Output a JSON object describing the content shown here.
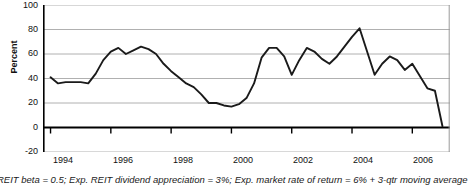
{
  "chart_data": {
    "type": "line",
    "title": "",
    "subtitle": "",
    "xlabel": "",
    "ylabel": "Percent",
    "ylim": [
      -20,
      100
    ],
    "xlim": [
      1993.75,
      2007.25
    ],
    "ytick_labels": [
      "100",
      "80",
      "60",
      "40",
      "20",
      "0",
      "-20"
    ],
    "ytick_values": [
      100,
      80,
      60,
      40,
      20,
      0,
      -20
    ],
    "xtick_labels": [
      "1994",
      "1996",
      "1998",
      "2000",
      "2002",
      "2004",
      "2006"
    ],
    "xtick_values": [
      1994,
      1996,
      1998,
      2000,
      2002,
      2004,
      2006
    ],
    "grid": true,
    "legend": false,
    "line_color": "#1a1a1a",
    "grid_color": "#b0b0b0",
    "axis_color": "#000000",
    "series": [
      {
        "name": "REIT implied expected return spread",
        "x": [
          1994.0,
          1994.25,
          1994.5,
          1994.75,
          1995.0,
          1995.25,
          1995.5,
          1995.75,
          1996.0,
          1996.25,
          1996.5,
          1996.75,
          1997.0,
          1997.25,
          1997.5,
          1997.75,
          1998.0,
          1998.25,
          1998.5,
          1998.75,
          1999.0,
          1999.25,
          1999.5,
          1999.75,
          2000.0,
          2000.25,
          2000.5,
          2000.75,
          2001.0,
          2001.25,
          2001.5,
          2001.75,
          2002.0,
          2002.25,
          2002.5,
          2002.75,
          2003.0,
          2003.25,
          2003.5,
          2003.75,
          2004.0,
          2004.25,
          2004.5,
          2004.75,
          2005.0,
          2005.25,
          2005.5,
          2005.75,
          2006.0,
          2006.25,
          2006.5,
          2006.75,
          2007.0
        ],
        "y": [
          41,
          36,
          37,
          37,
          37,
          36,
          44,
          55,
          62,
          65,
          60,
          63,
          66,
          64,
          60,
          52,
          46,
          41,
          36,
          33,
          27,
          20,
          20,
          18,
          17,
          19,
          24,
          36,
          57,
          65,
          65,
          58,
          43,
          55,
          65,
          62,
          56,
          52,
          58,
          66,
          74,
          81,
          62,
          43,
          52,
          58,
          55,
          47,
          52,
          42,
          32,
          30,
          1
        ]
      }
    ]
  },
  "caption": {
    "text": "REIT beta = 0.5; Exp. REIT dividend appreciation = 3%; Exp. market rate of return = 6% + 3-qtr moving average"
  }
}
